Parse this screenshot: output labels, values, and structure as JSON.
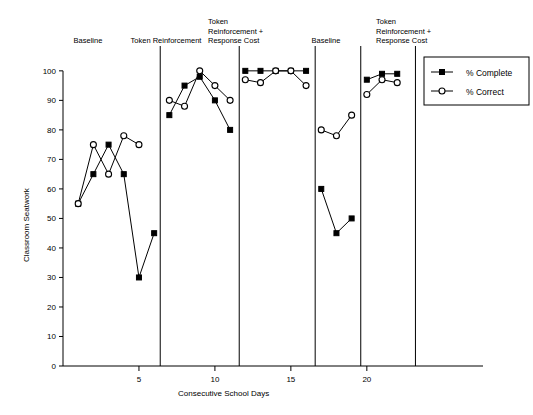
{
  "chart_data": {
    "type": "line",
    "title": "",
    "xlabel": "Consecutive School Days",
    "ylabel": "Classroom Seatwork",
    "xlim": [
      0,
      23.5
    ],
    "ylim": [
      0,
      103
    ],
    "xticks": [
      5,
      10,
      15,
      20
    ],
    "yticks": [
      0,
      10,
      20,
      30,
      40,
      50,
      60,
      70,
      80,
      90,
      100
    ],
    "grid": false,
    "legend_position": "right",
    "series": [
      {
        "name": "% Complete",
        "marker": "filled-square",
        "x": [
          1,
          2,
          3,
          4,
          5,
          6,
          7,
          8,
          9,
          10,
          11,
          12,
          13,
          14,
          15,
          16,
          17,
          18,
          19,
          20,
          21,
          22
        ],
        "values": [
          55,
          65,
          75,
          65,
          30,
          45,
          85,
          95,
          98,
          90,
          80,
          100,
          100,
          100,
          100,
          100,
          60,
          45,
          50,
          97,
          99,
          99
        ]
      },
      {
        "name": "% Correct",
        "marker": "open-circle",
        "x": [
          1,
          2,
          3,
          4,
          5,
          6,
          7,
          8,
          9,
          10,
          11,
          12,
          13,
          14,
          15,
          16,
          17,
          18,
          19,
          20,
          21,
          22
        ],
        "values": [
          55,
          75,
          65,
          75,
          78,
          75,
          90,
          88,
          100,
          95,
          90,
          97,
          96,
          100,
          100,
          95,
          80,
          78,
          85,
          92,
          97,
          96
        ]
      }
    ],
    "phases": [
      {
        "id": "phase-baseline-1",
        "label": "Baseline",
        "x_start": 0.5,
        "x_end": 6.4,
        "complete": {
          "x": [
            1,
            2,
            3,
            4,
            5,
            6
          ],
          "y": [
            55,
            65,
            75,
            65,
            30,
            45
          ]
        },
        "correct": {
          "x": [
            1,
            2,
            3,
            4,
            5
          ],
          "y": [
            55,
            75,
            65,
            78,
            75
          ]
        }
      },
      {
        "id": "phase-token-reinforcement-1",
        "label": "Token Reinforcement",
        "x_start": 6.4,
        "x_end": 11.6,
        "complete": {
          "x": [
            7,
            8,
            9,
            10,
            11
          ],
          "y": [
            85,
            95,
            98,
            90,
            80
          ]
        },
        "correct": {
          "x": [
            7,
            8,
            9,
            10,
            11
          ],
          "y": [
            90,
            88,
            100,
            95,
            90
          ]
        }
      },
      {
        "id": "phase-token-response-cost-1",
        "label": "Token\nReinforcement +\nResponse Cost",
        "x_start": 11.6,
        "x_end": 16.6,
        "complete": {
          "x": [
            12,
            13,
            14,
            15,
            16
          ],
          "y": [
            100,
            100,
            100,
            100,
            100
          ]
        },
        "correct": {
          "x": [
            12,
            13,
            14,
            15,
            16
          ],
          "y": [
            97,
            96,
            100,
            100,
            95
          ]
        }
      },
      {
        "id": "phase-baseline-2",
        "label": "Baseline",
        "x_start": 16.6,
        "x_end": 19.6,
        "complete": {
          "x": [
            17,
            18,
            19
          ],
          "y": [
            60,
            45,
            50
          ]
        },
        "correct": {
          "x": [
            17,
            18,
            19
          ],
          "y": [
            80,
            78,
            85
          ]
        }
      },
      {
        "id": "phase-token-response-cost-2",
        "label": "Token\nReinforcement +\nResponse Cost",
        "x_start": 19.6,
        "x_end": 23.2,
        "complete": {
          "x": [
            20,
            21,
            22
          ],
          "y": [
            97,
            99,
            99
          ]
        },
        "correct": {
          "x": [
            20,
            21,
            22
          ],
          "y": [
            92,
            97,
            96
          ]
        }
      }
    ]
  },
  "legend": {
    "items": [
      {
        "label": "% Complete",
        "marker": "filled-square"
      },
      {
        "label": "% Correct",
        "marker": "open-circle"
      }
    ]
  },
  "axes": {
    "y_title": "Classroom Seatwork",
    "x_title": "Consecutive School Days"
  },
  "colors": {
    "line": "#000000",
    "background": "#ffffff",
    "axis": "#000000"
  }
}
